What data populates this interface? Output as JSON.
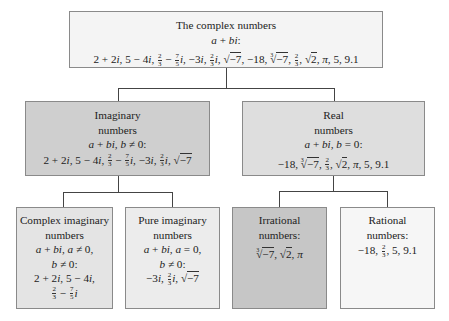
{
  "diagram": {
    "root": {
      "heading": "The complex numbers",
      "condition": "a + bi:",
      "examples_text": "2 + 2i, 5 − 4i, 2/3 − 7/5 i, −3i, 2/3 i, √−7, −18, ∛−7, 2/3, √2, π, 5, 9.1",
      "examples": [
        "2 + 2i",
        "5 − 4i",
        "2/3 − 7/5 i",
        "−3i",
        "2/3 i",
        "√−7",
        "−18",
        "∛−7",
        "2/3",
        "√2",
        "π",
        "5",
        "9.1"
      ]
    },
    "imaginary": {
      "heading_line1": "Imaginary",
      "heading_line2": "numbers",
      "condition": "a + bi, b ≠ 0:",
      "examples": [
        "2 + 2i",
        "5 − 4i",
        "2/3 − 7/5 i",
        "−3i",
        "2/3 i",
        "√−7"
      ]
    },
    "real": {
      "heading_line1": "Real",
      "heading_line2": "numbers",
      "condition": "a + bi, b = 0:",
      "examples": [
        "−18",
        "∛−7",
        "2/3",
        "√2",
        "π",
        "5",
        "9.1"
      ]
    },
    "complex_imaginary": {
      "heading_line1": "Complex imaginary",
      "heading_line2": "numbers",
      "condition_line1": "a + bi, a ≠ 0,",
      "condition_line2": "b ≠ 0:",
      "examples": [
        "2 + 2i",
        "5 − 4i",
        "2/3 − 7/5 i"
      ]
    },
    "pure_imaginary": {
      "heading_line1": "Pure imaginary",
      "heading_line2": "numbers",
      "condition_line1": "a + bi, a = 0,",
      "condition_line2": "b ≠ 0:",
      "examples": [
        "−3i",
        "2/3 i",
        "√−7"
      ]
    },
    "irrational": {
      "heading_line1": "Irrational",
      "heading_line2": "numbers:",
      "examples": [
        "∛−7",
        "√2",
        "π"
      ]
    },
    "rational": {
      "heading_line1": "Rational",
      "heading_line2": "numbers:",
      "examples": [
        "−18",
        "2/3",
        "5",
        "9.1"
      ]
    },
    "symbols": {
      "a": "a",
      "plus": " + ",
      "minus": " − ",
      "b": "b",
      "i": "i",
      "neq": " ≠ ",
      "eq": " = ",
      "comma": ", ",
      "colon": ":",
      "two": "2",
      "three": "3",
      "five": "5",
      "seven": "7",
      "neg7": "−7",
      "sqrt": "√",
      "pi": "π",
      "n2p2i": "2 + 2",
      "n5m4i": "5 − 4",
      "neg3": "−3",
      "neg18": "−18",
      "n5": "5",
      "n91": "9.1"
    },
    "colors": {
      "root_fill": "#f4f4f4",
      "imaginary_fill": "#cfcfcf",
      "real_fill": "#dedede",
      "complex_imaginary_fill": "#e4e4e4",
      "pure_imaginary_fill": "#ececec",
      "irrational_fill": "#c6c6c6",
      "rational_fill": "#f6f6f6",
      "border": "#8a8a8a",
      "connector": "#444444"
    }
  }
}
